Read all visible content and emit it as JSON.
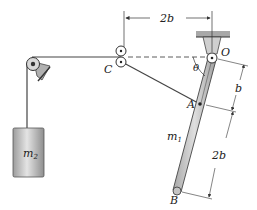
{
  "diagram": {
    "type": "mechanics-figure",
    "labels": {
      "pivot": "O",
      "pulley": "C",
      "attach_point": "A",
      "rod_end": "B",
      "angle": "θ",
      "rod_mass": "m",
      "rod_mass_sub": "1",
      "block_mass": "m",
      "block_mass_sub": "2"
    },
    "dimensions": {
      "horizontal_c_to_o": "2b",
      "o_to_a": "b",
      "a_to_b": "2b"
    },
    "colors": {
      "line": "#333333",
      "rod_fill": "#c8c8c8",
      "block_fill": "#b8b8b8",
      "ceiling": "#9a9a9a"
    }
  }
}
